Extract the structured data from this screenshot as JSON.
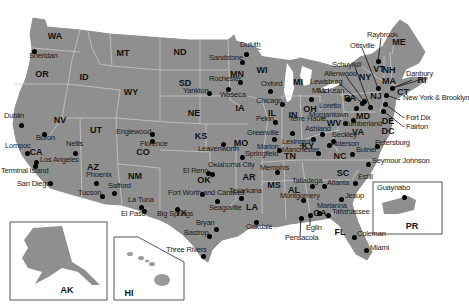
{
  "map": {
    "title": "",
    "colors": {
      "land": "#8f8f8f",
      "border": "#c8c8c8",
      "water": "#ffffff",
      "dot": "#000000",
      "inset_border": "#555555"
    },
    "states": [
      {
        "abbr": "WA",
        "x": 55,
        "y": 36
      },
      {
        "abbr": "OR",
        "x": 42,
        "y": 74
      },
      {
        "abbr": "ID",
        "x": 84,
        "y": 77
      },
      {
        "abbr": "MT",
        "x": 123,
        "y": 53
      },
      {
        "abbr": "WY",
        "x": 131,
        "y": 92
      },
      {
        "abbr": "ND",
        "x": 180,
        "y": 52
      },
      {
        "abbr": "SD",
        "x": 185,
        "y": 83
      },
      {
        "abbr": "NE",
        "x": 194,
        "y": 113
      },
      {
        "abbr": "MN",
        "x": 237,
        "y": 74
      },
      {
        "abbr": "WI",
        "x": 262,
        "y": 70
      },
      {
        "abbr": "IA",
        "x": 240,
        "y": 108
      },
      {
        "abbr": "MI",
        "x": 298,
        "y": 82
      },
      {
        "abbr": "IL",
        "x": 272,
        "y": 113
      },
      {
        "abbr": "IN",
        "x": 293,
        "y": 115
      },
      {
        "abbr": "OH",
        "x": 310,
        "y": 109
      },
      {
        "abbr": "NV",
        "x": 60,
        "y": 120
      },
      {
        "abbr": "UT",
        "x": 96,
        "y": 130
      },
      {
        "abbr": "CO",
        "x": 143,
        "y": 152
      },
      {
        "abbr": "KS",
        "x": 201,
        "y": 136
      },
      {
        "abbr": "MO",
        "x": 241,
        "y": 143
      },
      {
        "abbr": "CA",
        "x": 36,
        "y": 152
      },
      {
        "abbr": "AZ",
        "x": 93,
        "y": 167
      },
      {
        "abbr": "NM",
        "x": 135,
        "y": 176
      },
      {
        "abbr": "OK",
        "x": 204,
        "y": 180
      },
      {
        "abbr": "AR",
        "x": 249,
        "y": 177
      },
      {
        "abbr": "TX",
        "x": 181,
        "y": 213
      },
      {
        "abbr": "LA",
        "x": 252,
        "y": 207
      },
      {
        "abbr": "MS",
        "x": 274,
        "y": 185
      },
      {
        "abbr": "AL",
        "x": 294,
        "y": 190
      },
      {
        "abbr": "GA",
        "x": 320,
        "y": 213
      },
      {
        "abbr": "TN",
        "x": 290,
        "y": 156
      },
      {
        "abbr": "KY",
        "x": 308,
        "y": 146
      },
      {
        "abbr": "WV",
        "x": 334,
        "y": 123
      },
      {
        "abbr": "VA",
        "x": 358,
        "y": 132
      },
      {
        "abbr": "NC",
        "x": 340,
        "y": 156
      },
      {
        "abbr": "SC",
        "x": 343,
        "y": 173
      },
      {
        "abbr": "FL",
        "x": 340,
        "y": 232
      },
      {
        "abbr": "PA",
        "x": 350,
        "y": 98
      },
      {
        "abbr": "NY",
        "x": 365,
        "y": 77
      },
      {
        "abbr": "NJ",
        "x": 376,
        "y": 96
      },
      {
        "abbr": "MD",
        "x": 363,
        "y": 116
      },
      {
        "abbr": "DE",
        "x": 388,
        "y": 121
      },
      {
        "abbr": "DC",
        "x": 388,
        "y": 131
      },
      {
        "abbr": "VT",
        "x": 379,
        "y": 69
      },
      {
        "abbr": "NH",
        "x": 389,
        "y": 70
      },
      {
        "abbr": "MA",
        "x": 389,
        "y": 81
      },
      {
        "abbr": "ME",
        "x": 399,
        "y": 42
      },
      {
        "abbr": "CT",
        "x": 403,
        "y": 92
      },
      {
        "abbr": "RI",
        "x": 422,
        "y": 80
      },
      {
        "abbr": "AK",
        "x": 67,
        "y": 290
      },
      {
        "abbr": "HI",
        "x": 129,
        "y": 293
      },
      {
        "abbr": "PR",
        "x": 412,
        "y": 226
      }
    ],
    "locations": [
      {
        "name": "Sheridan",
        "x": 34,
        "y": 51,
        "lx": 29,
        "ly": 55
      },
      {
        "name": "Dublin",
        "x": 21,
        "y": 125,
        "lx": 4,
        "ly": 115
      },
      {
        "name": "Boron",
        "x": 44,
        "y": 134,
        "lx": 36,
        "ly": 137
      },
      {
        "name": "Lompoc",
        "x": 27,
        "y": 153,
        "lx": 5,
        "ly": 145
      },
      {
        "name": "Los Angeles",
        "x": 36,
        "y": 162,
        "lx": 40,
        "ly": 159
      },
      {
        "name": "Terminal Island",
        "x": 35,
        "y": 166,
        "lx": 1,
        "ly": 170
      },
      {
        "name": "San Diego",
        "x": 50,
        "y": 183,
        "lx": 17,
        "ly": 183
      },
      {
        "name": "Nellis",
        "x": 75,
        "y": 153,
        "lx": 66,
        "ly": 143
      },
      {
        "name": "Phoenix",
        "x": 96,
        "y": 183,
        "lx": 86,
        "ly": 174
      },
      {
        "name": "Tucson",
        "x": 102,
        "y": 196,
        "lx": 78,
        "ly": 192
      },
      {
        "name": "Safford",
        "x": 114,
        "y": 193,
        "lx": 108,
        "ly": 185
      },
      {
        "name": "La Tuna",
        "x": 141,
        "y": 207,
        "lx": 128,
        "ly": 199
      },
      {
        "name": "El Paso",
        "x": 144,
        "y": 211,
        "lx": 121,
        "ly": 213
      },
      {
        "name": "Englewood",
        "x": 152,
        "y": 134,
        "lx": 116,
        "ly": 131
      },
      {
        "name": "Florence",
        "x": 152,
        "y": 141,
        "lx": 140,
        "ly": 143
      },
      {
        "name": "Duluth",
        "x": 246,
        "y": 54,
        "lx": 240,
        "ly": 44
      },
      {
        "name": "Sandstone",
        "x": 242,
        "y": 62,
        "lx": 209,
        "ly": 57
      },
      {
        "name": "Rochester",
        "x": 240,
        "y": 82,
        "lx": 209,
        "ly": 78
      },
      {
        "name": "Waseca",
        "x": 228,
        "y": 89,
        "lx": 220,
        "ly": 94
      },
      {
        "name": "Yankton",
        "x": 209,
        "y": 93,
        "lx": 183,
        "ly": 90
      },
      {
        "name": "Oxford",
        "x": 270,
        "y": 91,
        "lx": 261,
        "ly": 83
      },
      {
        "name": "Chicago",
        "x": 282,
        "y": 104,
        "lx": 256,
        "ly": 100
      },
      {
        "name": "Milan",
        "x": 311,
        "y": 99,
        "lx": 312,
        "ly": 90
      },
      {
        "name": "Pekin",
        "x": 275,
        "y": 122,
        "lx": 256,
        "ly": 118
      },
      {
        "name": "Terre Haute",
        "x": 292,
        "y": 133,
        "lx": 289,
        "ly": 118
      },
      {
        "name": "Greenville",
        "x": 274,
        "y": 139,
        "lx": 247,
        "ly": 132
      },
      {
        "name": "Marion",
        "x": 279,
        "y": 150,
        "lx": 257,
        "ly": 146
      },
      {
        "name": "Lexington",
        "x": 313,
        "y": 139,
        "lx": 282,
        "ly": 141
      },
      {
        "name": "Springfield",
        "x": 242,
        "y": 157,
        "lx": 245,
        "ly": 153
      },
      {
        "name": "Manchester",
        "x": 318,
        "y": 153,
        "lx": 282,
        "ly": 149
      },
      {
        "name": "Memphis",
        "x": 277,
        "y": 172,
        "lx": 260,
        "ly": 167
      },
      {
        "name": "Leavenworth",
        "x": 223,
        "y": 144,
        "lx": 198,
        "ly": 148
      },
      {
        "name": "Oklahoma City",
        "x": 212,
        "y": 174,
        "lx": 208,
        "ly": 164
      },
      {
        "name": "El Reno",
        "x": 208,
        "y": 173,
        "lx": 183,
        "ly": 170
      },
      {
        "name": "Texarkana",
        "x": 241,
        "y": 198,
        "lx": 229,
        "ly": 190
      },
      {
        "name": "Fort Worth and Carswell",
        "x": 202,
        "y": 194,
        "lx": 168,
        "ly": 192
      },
      {
        "name": "Seagoville",
        "x": 217,
        "y": 201,
        "lx": 209,
        "ly": 207
      },
      {
        "name": "Big Springs",
        "x": 177,
        "y": 209,
        "lx": 157,
        "ly": 213
      },
      {
        "name": "Bryan",
        "x": 216,
        "y": 229,
        "lx": 196,
        "ly": 222
      },
      {
        "name": "Bastrop",
        "x": 209,
        "y": 236,
        "lx": 184,
        "ly": 232
      },
      {
        "name": "Three Rivers",
        "x": 203,
        "y": 256,
        "lx": 166,
        "ly": 249
      },
      {
        "name": "Oakdale",
        "x": 256,
        "y": 222,
        "lx": 246,
        "ly": 226
      },
      {
        "name": "Talladega",
        "x": 312,
        "y": 186,
        "lx": 292,
        "ly": 180
      },
      {
        "name": "Montgomery",
        "x": 303,
        "y": 200,
        "lx": 280,
        "ly": 195
      },
      {
        "name": "Atlanta",
        "x": 324,
        "y": 186,
        "lx": 327,
        "ly": 182
      },
      {
        "name": "Marianna",
        "x": 319,
        "y": 213,
        "lx": 317,
        "ly": 205
      },
      {
        "name": "Tallahassee",
        "x": 328,
        "y": 215,
        "lx": 332,
        "ly": 211
      },
      {
        "name": "Pensacola",
        "x": 301,
        "y": 218,
        "lx": 285,
        "ly": 237
      },
      {
        "name": "Eglin",
        "x": 310,
        "y": 215,
        "lx": 306,
        "ly": 227
      },
      {
        "name": "Jesup",
        "x": 341,
        "y": 199,
        "lx": 345,
        "ly": 195
      },
      {
        "name": "Estill",
        "x": 355,
        "y": 183,
        "lx": 358,
        "ly": 176
      },
      {
        "name": "Coleman",
        "x": 354,
        "y": 237,
        "lx": 357,
        "ly": 233
      },
      {
        "name": "Miami",
        "x": 366,
        "y": 250,
        "lx": 370,
        "ly": 247
      },
      {
        "name": "Seymour Johnson",
        "x": 368,
        "y": 164,
        "lx": 372,
        "ly": 160
      },
      {
        "name": "Butner",
        "x": 352,
        "y": 154,
        "lx": 356,
        "ly": 149
      },
      {
        "name": "Petersburg",
        "x": 377,
        "y": 146,
        "lx": 375,
        "ly": 142
      },
      {
        "name": "Alderson",
        "x": 329,
        "y": 145,
        "lx": 331,
        "ly": 143
      },
      {
        "name": "Beckley",
        "x": 333,
        "y": 141,
        "lx": 332,
        "ly": 134
      },
      {
        "name": "Ashland",
        "x": 322,
        "y": 134,
        "lx": 305,
        "ly": 128
      },
      {
        "name": "Morgantown",
        "x": 345,
        "y": 123,
        "lx": 309,
        "ly": 114
      },
      {
        "name": "Cumberland",
        "x": 353,
        "y": 120,
        "lx": 343,
        "ly": 123
      },
      {
        "name": "Loretto",
        "x": 356,
        "y": 108,
        "lx": 319,
        "ly": 105
      },
      {
        "name": "McKean",
        "x": 348,
        "y": 99,
        "lx": 318,
        "ly": 90
      },
      {
        "name": "Lewisburg",
        "x": 362,
        "y": 103,
        "lx": 310,
        "ly": 81
      },
      {
        "name": "Allenwood",
        "x": 364,
        "y": 101,
        "lx": 324,
        "ly": 73
      },
      {
        "name": "Schuylkill",
        "x": 370,
        "y": 107,
        "lx": 332,
        "ly": 64
      },
      {
        "name": "Otisville",
        "x": 378,
        "y": 88,
        "lx": 350,
        "ly": 45
      },
      {
        "name": "Raybrook",
        "x": 378,
        "y": 61,
        "lx": 367,
        "ly": 34
      },
      {
        "name": "Danbury",
        "x": 392,
        "y": 88,
        "lx": 406,
        "ly": 73
      },
      {
        "name": "New York & Brooklyn",
        "x": 386,
        "y": 95,
        "lx": 403,
        "ly": 97
      },
      {
        "name": "Fort Dix",
        "x": 385,
        "y": 104,
        "lx": 406,
        "ly": 117
      },
      {
        "name": "Fairton",
        "x": 383,
        "y": 111,
        "lx": 406,
        "ly": 126
      },
      {
        "name": "Guaynabo",
        "x": 404,
        "y": 197,
        "lx": 377,
        "ly": 187
      }
    ]
  }
}
